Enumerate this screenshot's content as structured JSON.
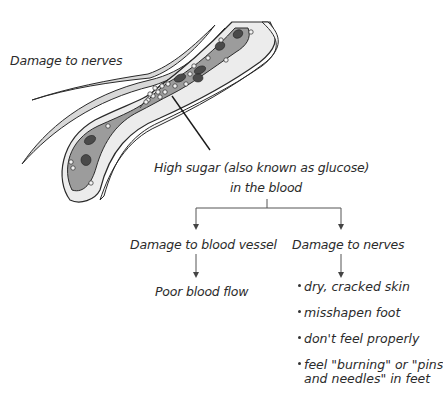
{
  "diagram": {
    "illustration": {
      "label": "Damage to nerves",
      "description": "Cross-section of a blood vessel with narrowed section crowded with glucose particles, red blood cells, and adjacent nerve fibers",
      "colors": {
        "vessel_wall": "#e6e6e6",
        "vessel_lumen": "#9a9a9a",
        "blood_cell": "#4a4a4a",
        "glucose": "#f2f2f2",
        "outline": "#2a2a2a"
      }
    },
    "root": {
      "line1": "High sugar (also known as glucose)",
      "line2": "in the blood"
    },
    "branches": [
      {
        "label": "Damage to blood vessel",
        "outcome": "Poor blood flow"
      },
      {
        "label": "Damage to nerves",
        "outcomes": [
          "dry, cracked skin",
          "misshapen foot",
          "don't feel properly",
          "feel \"burning\" or \"pins",
          "and needles\" in feet"
        ]
      }
    ]
  }
}
